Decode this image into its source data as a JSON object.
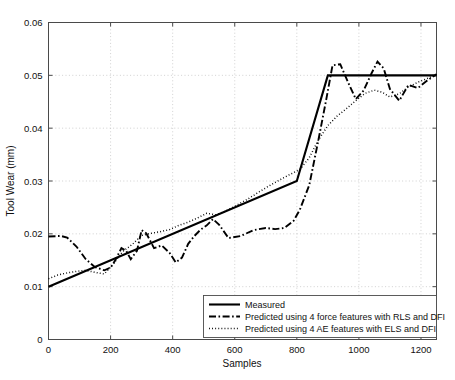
{
  "chart_data": {
    "type": "line",
    "title": "",
    "xlabel": "Samples",
    "ylabel": "Tool Wear (mm)",
    "xlim": [
      0,
      1250
    ],
    "ylim": [
      0,
      0.06
    ],
    "xticks": [
      0,
      200,
      400,
      600,
      800,
      1000,
      1200
    ],
    "xtick_labels": [
      "0",
      "200",
      "400",
      "600",
      "800",
      "1000",
      "1200"
    ],
    "yticks": [
      0,
      0.01,
      0.02,
      0.03,
      0.04,
      0.05,
      0.06
    ],
    "ytick_labels": [
      "0",
      "0.01",
      "0.02",
      "0.03",
      "0.04",
      "0.05",
      "0.06"
    ],
    "grid": true,
    "grid_style": "dotted",
    "legend_position": "lower right",
    "line_color": "#000000",
    "series": [
      {
        "name": "Measured",
        "style": "solid",
        "x": [
          0,
          800,
          900,
          1250
        ],
        "values": [
          0.01,
          0.03,
          0.05,
          0.05
        ]
      },
      {
        "name": "Predicted using 4 force features with RLS and DFI",
        "style": "dash-dot",
        "x": [
          0,
          40,
          60,
          90,
          120,
          150,
          180,
          200,
          215,
          235,
          250,
          265,
          285,
          300,
          315,
          340,
          365,
          390,
          410,
          430,
          450,
          470,
          490,
          510,
          530,
          550,
          580,
          620,
          660,
          700,
          730,
          760,
          790,
          810,
          840,
          870,
          895,
          915,
          940,
          965,
          990,
          1015,
          1040,
          1060,
          1080,
          1100,
          1130,
          1160,
          1190,
          1220,
          1250
        ],
        "values": [
          0.0195,
          0.0196,
          0.0193,
          0.0176,
          0.0152,
          0.0137,
          0.0131,
          0.0136,
          0.015,
          0.0173,
          0.0168,
          0.0152,
          0.0168,
          0.0207,
          0.0201,
          0.0173,
          0.0178,
          0.0164,
          0.0146,
          0.0155,
          0.0181,
          0.0196,
          0.0208,
          0.0216,
          0.0228,
          0.0217,
          0.0192,
          0.0196,
          0.0207,
          0.0211,
          0.0209,
          0.0211,
          0.0225,
          0.0246,
          0.0292,
          0.0379,
          0.0455,
          0.0519,
          0.0521,
          0.0487,
          0.0455,
          0.0471,
          0.0503,
          0.0526,
          0.0513,
          0.0474,
          0.0452,
          0.0482,
          0.0476,
          0.049,
          0.0502
        ]
      },
      {
        "name": "Predicted using 4 AE features with ELS and DFI",
        "style": "dotted",
        "x": [
          0,
          30,
          60,
          90,
          120,
          150,
          180,
          210,
          240,
          270,
          300,
          330,
          360,
          390,
          420,
          450,
          480,
          510,
          540,
          570,
          600,
          640,
          680,
          720,
          760,
          790,
          810,
          840,
          870,
          900,
          930,
          960,
          990,
          1020,
          1050,
          1075,
          1100,
          1130,
          1160,
          1190,
          1220,
          1250
        ],
        "values": [
          0.0115,
          0.0122,
          0.0126,
          0.0129,
          0.0131,
          0.0127,
          0.0124,
          0.0144,
          0.0167,
          0.018,
          0.0197,
          0.0201,
          0.0204,
          0.0208,
          0.0216,
          0.0222,
          0.023,
          0.0239,
          0.0236,
          0.0243,
          0.0252,
          0.0265,
          0.028,
          0.0294,
          0.0307,
          0.0316,
          0.0322,
          0.0344,
          0.0378,
          0.0405,
          0.0423,
          0.0437,
          0.0452,
          0.0466,
          0.0472,
          0.0468,
          0.0459,
          0.0465,
          0.0478,
          0.0487,
          0.0494,
          0.0502
        ]
      }
    ]
  },
  "legend": {
    "entries": [
      "Measured",
      "Predicted using 4 force features with RLS and DFI",
      "Predicted using 4 AE features with ELS and DFI"
    ]
  }
}
